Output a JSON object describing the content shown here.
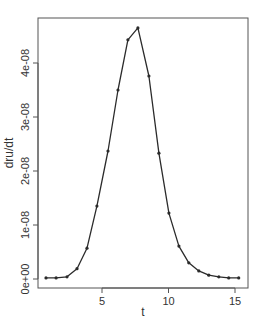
{
  "chart_data": {
    "type": "line",
    "title": "",
    "xlabel": "t",
    "ylabel": "dru/dt",
    "xlim": [
      0.2,
      15.9
    ],
    "ylim": [
      -1.7e-09,
      4.76e-08
    ],
    "xticks": [
      5,
      10,
      15
    ],
    "xtick_labels": [
      "5",
      "10",
      "15"
    ],
    "yticks": [
      0,
      1e-08,
      2e-08,
      3e-08,
      4e-08
    ],
    "ytick_labels": [
      "0e+00",
      "1e-08",
      "2e-08",
      "3e-08",
      "4e-08"
    ],
    "grid": false,
    "legend": null,
    "markers": true,
    "series": [
      {
        "name": "dru/dt",
        "x": [
          0.79,
          1.55,
          2.37,
          3.12,
          3.87,
          4.62,
          5.45,
          6.2,
          6.95,
          7.7,
          8.53,
          9.28,
          10.03,
          10.78,
          11.53,
          12.28,
          13.03,
          13.78,
          14.53,
          15.28
        ],
        "values": [
          2e-10,
          2e-10,
          4e-10,
          1.9e-09,
          5.7e-09,
          1.35e-08,
          2.37e-08,
          3.5e-08,
          4.43e-08,
          4.65e-08,
          3.76e-08,
          2.33e-08,
          1.22e-08,
          6.1e-09,
          3e-09,
          1.5e-09,
          7e-10,
          4e-10,
          2e-10,
          2e-10
        ]
      }
    ],
    "colors": {
      "line": "#2b2b2b",
      "frame": "#555555",
      "text": "#333333"
    }
  }
}
